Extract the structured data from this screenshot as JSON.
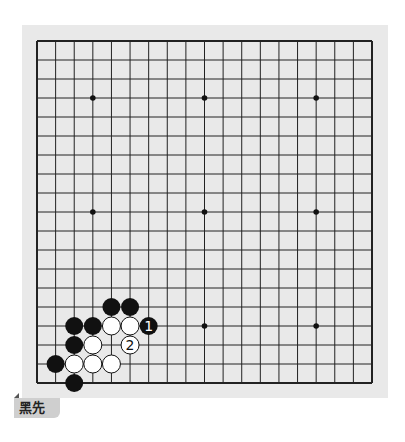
{
  "problem": {
    "label": "黑先",
    "board_size": 19,
    "star_points": [
      [
        3,
        3
      ],
      [
        3,
        9
      ],
      [
        3,
        15
      ],
      [
        9,
        3
      ],
      [
        9,
        9
      ],
      [
        9,
        15
      ],
      [
        15,
        3
      ],
      [
        15,
        9
      ],
      [
        15,
        15
      ]
    ],
    "stones": [
      {
        "color": "black",
        "col": 4,
        "row": 14
      },
      {
        "color": "black",
        "col": 5,
        "row": 14
      },
      {
        "color": "black",
        "col": 2,
        "row": 15
      },
      {
        "color": "black",
        "col": 3,
        "row": 15
      },
      {
        "color": "white",
        "col": 4,
        "row": 15
      },
      {
        "color": "white",
        "col": 5,
        "row": 15
      },
      {
        "color": "black",
        "col": 6,
        "row": 15,
        "number": "1"
      },
      {
        "color": "black",
        "col": 2,
        "row": 16
      },
      {
        "color": "white",
        "col": 3,
        "row": 16
      },
      {
        "color": "white",
        "col": 5,
        "row": 16,
        "number": "2"
      },
      {
        "color": "black",
        "col": 1,
        "row": 17
      },
      {
        "color": "white",
        "col": 2,
        "row": 17
      },
      {
        "color": "white",
        "col": 3,
        "row": 17
      },
      {
        "color": "white",
        "col": 4,
        "row": 17
      },
      {
        "color": "black",
        "col": 2,
        "row": 18
      }
    ]
  },
  "colors": {
    "board": "#e9e9e9",
    "line": "#222222",
    "black_stone": "#111111",
    "white_stone": "#ffffff",
    "label_bg": "#cfcfcf"
  }
}
